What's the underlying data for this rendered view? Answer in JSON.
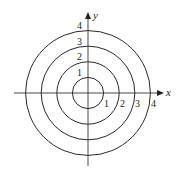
{
  "diagram": {
    "type": "concentric-circles-polar-grid",
    "center": {
      "x": 88,
      "y": 93
    },
    "unit_px": 15.6,
    "axes": {
      "x_label": "x",
      "y_label": "y",
      "color": "#333333"
    },
    "circles": [
      {
        "radius": 1,
        "label": "1"
      },
      {
        "radius": 2,
        "label": "2"
      },
      {
        "radius": 3,
        "label": "3"
      },
      {
        "radius": 4,
        "label": "4"
      }
    ],
    "y_axis_labels": [
      "1",
      "2",
      "3",
      "4"
    ],
    "x_axis_labels": [
      "1",
      "2",
      "3",
      "4"
    ],
    "stroke_color": "#2a2a2a"
  }
}
